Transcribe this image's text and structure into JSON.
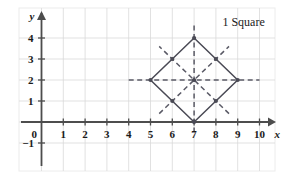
{
  "chart_data": {
    "type": "scatter",
    "title": "",
    "annotations": [
      {
        "text": "1 Square",
        "x": 8.3,
        "y": 4.75
      }
    ],
    "xlabel": "x",
    "ylabel": "y",
    "xlim": [
      -0.55,
      10.9
    ],
    "ylim": [
      -1.55,
      4.95
    ],
    "grid": true,
    "xticks": [
      0,
      1,
      2,
      3,
      4,
      5,
      6,
      7,
      8,
      9,
      10
    ],
    "xtick_labels": [
      "0",
      "1",
      "2",
      "3",
      "4",
      "5",
      "6",
      "7",
      "8",
      "9",
      "10"
    ],
    "yticks": [
      -1,
      0,
      1,
      2,
      3,
      4
    ],
    "ytick_labels": [
      "−1",
      "0",
      "1",
      "2",
      "3",
      "4"
    ],
    "series": [
      {
        "name": "square-outline",
        "type": "polygon",
        "closed": true,
        "style": "solid",
        "points": [
          {
            "x": 7,
            "y": 4
          },
          {
            "x": 9,
            "y": 2
          },
          {
            "x": 7,
            "y": 0
          },
          {
            "x": 5,
            "y": 2
          }
        ]
      },
      {
        "name": "vertical-axis-of-symmetry",
        "type": "line",
        "style": "dashed",
        "points": [
          {
            "x": 7,
            "y": -0.5
          },
          {
            "x": 7,
            "y": 4.6
          }
        ]
      },
      {
        "name": "horizontal-axis-of-symmetry",
        "type": "line",
        "style": "dashed",
        "points": [
          {
            "x": 4,
            "y": 2
          },
          {
            "x": 10,
            "y": 2
          }
        ]
      },
      {
        "name": "diagonal-axis-of-symmetry-up-right",
        "type": "line",
        "style": "dashed",
        "points": [
          {
            "x": 5.4,
            "y": 0.4
          },
          {
            "x": 8.6,
            "y": 3.6
          }
        ]
      },
      {
        "name": "diagonal-axis-of-symmetry-up-left",
        "type": "line",
        "style": "dashed",
        "points": [
          {
            "x": 8.6,
            "y": 0.4
          },
          {
            "x": 5.4,
            "y": 3.6
          }
        ]
      }
    ],
    "markers": [
      {
        "name": "vertex-top",
        "x": 7,
        "y": 4
      },
      {
        "name": "vertex-right",
        "x": 9,
        "y": 2
      },
      {
        "name": "vertex-bottom",
        "x": 7,
        "y": 0
      },
      {
        "name": "vertex-left",
        "x": 5,
        "y": 2
      },
      {
        "name": "edge-midpoint-upper-left",
        "x": 6,
        "y": 3
      },
      {
        "name": "edge-midpoint-upper-right",
        "x": 8,
        "y": 3
      },
      {
        "name": "edge-midpoint-lower-right",
        "x": 8,
        "y": 1
      },
      {
        "name": "edge-midpoint-lower-left",
        "x": 6,
        "y": 1
      },
      {
        "name": "center-of-symmetry",
        "x": 7,
        "y": 2
      }
    ],
    "colors": {
      "grid": "#d9d9d9",
      "axis": "#4d4d4d",
      "shape": "#4a4a55",
      "dashed": "#5a5a66",
      "text": "#1a1a1a",
      "background": "#ffffff",
      "frame": "#e6e6e6"
    }
  }
}
